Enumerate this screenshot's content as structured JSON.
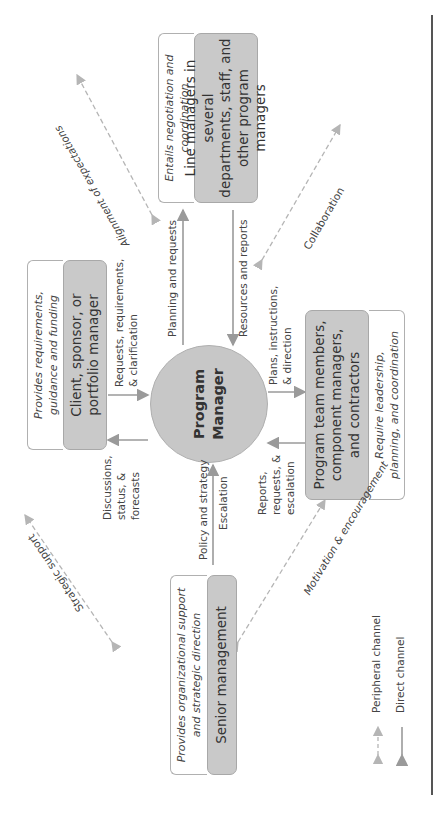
{
  "center": {
    "label": "Program\nManager"
  },
  "nodes": {
    "client": {
      "label": "Client, sponsor, or\nportfolio manager",
      "note": "Provides requirements,\nguidance and funding"
    },
    "line_managers": {
      "label": "Line managers in several\ndepartments, staff, and\nother program managers",
      "note": "Entails negotiation and\ncoordination"
    },
    "senior": {
      "label": "Senior management",
      "note": "Provides organizational support\nand strategic direction"
    },
    "team": {
      "label": "Program team members,\ncomponent managers,\nand contractors",
      "note": "Require leadership,\nplanning, and coordination"
    }
  },
  "direct_labels": {
    "client_to_pm": "Requests, requirements,\n& clarification",
    "pm_to_client": "Discussions,\nstatus, &\nforecasts",
    "pm_to_line": "Planning and requests",
    "line_to_pm": "Resources and reports",
    "senior_to_pm": "Policy and strategy",
    "pm_to_senior": "Escalation",
    "pm_to_team": "Plans, instructions,\n& direction",
    "team_to_pm": "Reports,\nrequests, &\nescalation"
  },
  "peripheral_labels": {
    "client_line": "Alignment of expectations",
    "line_team": "Collaboration",
    "client_senior": "Strategic support",
    "senior_team": "Motivation\n& encouragement"
  },
  "legend": {
    "peripheral": "Peripheral channel",
    "direct": "Direct channel"
  },
  "colors": {
    "node_fill": "#c9c9c9",
    "line": "#9a9a9a",
    "dashed": "#b5b5b5",
    "rule": "#555555"
  }
}
